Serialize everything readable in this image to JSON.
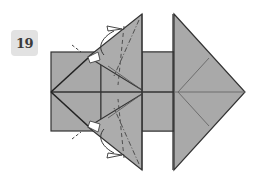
{
  "step": {
    "number": "19"
  },
  "colors": {
    "paper_fill": "#a9a9a9",
    "paper_fill_light": "#b4b4b4",
    "edge": "#333333",
    "crease": "#6a6a6a",
    "badge_bg": "#e2e2e2"
  },
  "diagram": {
    "arrows": [
      "upper-flap-fold-arrow",
      "lower-flap-fold-arrow"
    ],
    "fold_lines": [
      "valley-dashed",
      "mountain-dash-dot"
    ]
  }
}
